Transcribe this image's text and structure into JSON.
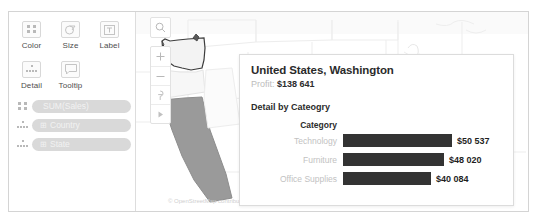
{
  "marks_card": {
    "buttons": [
      {
        "label": "Color",
        "icon": "color-squares-icon"
      },
      {
        "label": "Size",
        "icon": "size-circle-icon"
      },
      {
        "label": "Label",
        "icon": "label-text-icon"
      },
      {
        "label": "Detail",
        "icon": "detail-dots-icon"
      },
      {
        "label": "Tooltip",
        "icon": "tooltip-bubble-icon"
      }
    ],
    "pills": [
      {
        "label": "SUM(Sales)",
        "glyph": "",
        "icon": "color-squares-icon"
      },
      {
        "label": "Country",
        "glyph": "⊞",
        "icon": "detail-dots-icon"
      },
      {
        "label": "State",
        "glyph": "⊞",
        "icon": "detail-dots-icon"
      }
    ]
  },
  "map": {
    "toolbar": [
      {
        "name": "search-icon",
        "glyph": "⌕"
      },
      {
        "name": "zoom-in-icon",
        "glyph": "+"
      },
      {
        "name": "zoom-out-icon",
        "glyph": "−"
      },
      {
        "name": "pin-icon",
        "glyph": "⚑"
      },
      {
        "name": "play-icon",
        "glyph": "▶"
      }
    ],
    "attribution": "© OpenStreetMap contributors"
  },
  "tooltip": {
    "title": "United States, Washington",
    "profit_label": "Profit:",
    "profit_value": "$138 641",
    "detail_title": "Detail by Cateogry",
    "category_header": "Category"
  },
  "chart_data": {
    "type": "bar",
    "title": "Detail by Cateogry",
    "xlabel": "",
    "ylabel": "Category",
    "categories": [
      "Technology",
      "Furniture",
      "Office Supplies"
    ],
    "values": [
      50537,
      48020,
      40084
    ],
    "value_labels": [
      "$50 537",
      "$48 020",
      "$40 084"
    ],
    "bar_widths_px": [
      109,
      101,
      88
    ],
    "orientation": "horizontal",
    "grid": false,
    "legend": "none",
    "bar_color": "#333333"
  }
}
